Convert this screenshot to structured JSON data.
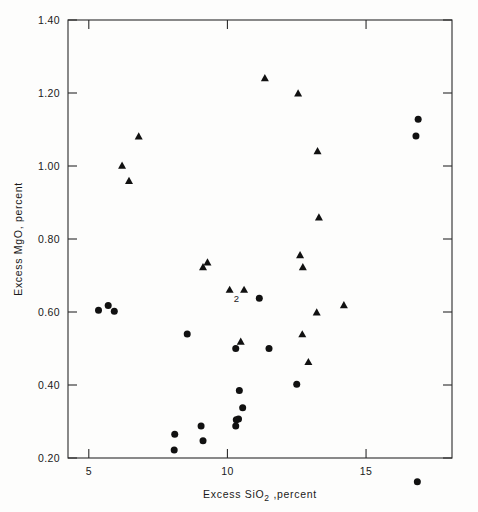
{
  "chart_data": {
    "type": "scatter",
    "title": "",
    "xlabel": "Excess  SiO2 ,percent",
    "xlabel_parts": {
      "pre": "Excess  SiO",
      "sub": "2",
      "post": " ,percent"
    },
    "ylabel": "Excess  MgO, percent",
    "xlim": [
      4.25,
      18.1
    ],
    "ylim": [
      0.2,
      1.4
    ],
    "xticks": [
      5,
      10,
      15
    ],
    "xtick_labels": [
      "5",
      "10",
      "15"
    ],
    "yticks": [
      0.2,
      0.4,
      0.6,
      0.8,
      1.0,
      1.2,
      1.4
    ],
    "ytick_labels": [
      "0.20",
      "0.40",
      "0.60",
      "0.80",
      "1.00",
      "1.20",
      "1.40"
    ],
    "grid": false,
    "legend": "none",
    "frame": "box",
    "marker_colors": {
      "circle": "#111111",
      "triangle": "#111111"
    },
    "series": [
      {
        "name": "circles",
        "marker": "circle",
        "points": [
          [
            5.35,
            0.605
          ],
          [
            5.7,
            0.618
          ],
          [
            5.92,
            0.602
          ],
          [
            8.1,
            0.265
          ],
          [
            8.08,
            0.222
          ],
          [
            8.55,
            0.54
          ],
          [
            9.05,
            0.288
          ],
          [
            9.12,
            0.247
          ],
          [
            10.3,
            0.5
          ],
          [
            10.32,
            0.305
          ],
          [
            10.4,
            0.307
          ],
          [
            10.3,
            0.288
          ],
          [
            10.43,
            0.385
          ],
          [
            10.55,
            0.338
          ],
          [
            11.15,
            0.638
          ],
          [
            11.5,
            0.5
          ],
          [
            12.5,
            0.402
          ],
          [
            16.85,
            0.135
          ],
          [
            16.88,
            1.128
          ],
          [
            16.8,
            1.082
          ]
        ]
      },
      {
        "name": "triangles",
        "marker": "triangle",
        "points": [
          [
            6.2,
            1.0
          ],
          [
            6.45,
            0.958
          ],
          [
            6.8,
            1.08
          ],
          [
            9.12,
            0.722
          ],
          [
            9.28,
            0.735
          ],
          [
            10.08,
            0.66
          ],
          [
            10.6,
            0.66
          ],
          [
            10.48,
            0.518
          ],
          [
            11.35,
            1.24
          ],
          [
            12.55,
            1.198
          ],
          [
            12.62,
            0.755
          ],
          [
            12.72,
            0.722
          ],
          [
            12.7,
            0.538
          ],
          [
            12.92,
            0.462
          ],
          [
            13.25,
            1.04
          ],
          [
            13.3,
            0.858
          ],
          [
            13.22,
            0.598
          ],
          [
            14.2,
            0.618
          ]
        ]
      }
    ],
    "annotations": [
      {
        "text": "2",
        "x": 10.32,
        "y": 0.638,
        "name": "overlap-count-label"
      }
    ]
  }
}
